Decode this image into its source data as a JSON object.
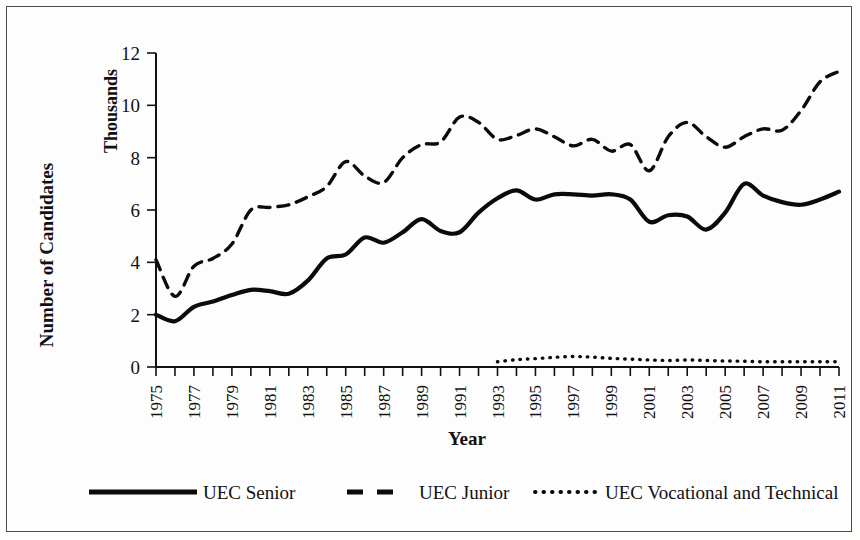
{
  "chart_data": {
    "type": "line",
    "title": "",
    "xlabel": "Year",
    "ylabel": "Number of Candidates",
    "unit_label": "Thousands",
    "xlim": [
      1975,
      2011
    ],
    "ylim": [
      0,
      12
    ],
    "ytick_step": 2,
    "yticks": [
      "0",
      "2",
      "4",
      "6",
      "8",
      "10",
      "12"
    ],
    "xticks": [
      "1975",
      "1977",
      "1979",
      "1981",
      "1983",
      "1985",
      "1987",
      "1989",
      "1991",
      "1993",
      "1995",
      "1997",
      "1999",
      "2001",
      "2003",
      "2005",
      "2007",
      "2009",
      "2011"
    ],
    "grid": false,
    "legend_position": "bottom",
    "x": [
      1975,
      1976,
      1977,
      1978,
      1979,
      1980,
      1981,
      1982,
      1983,
      1984,
      1985,
      1986,
      1987,
      1988,
      1989,
      1990,
      1991,
      1992,
      1993,
      1994,
      1995,
      1996,
      1997,
      1998,
      1999,
      2000,
      2001,
      2002,
      2003,
      2004,
      2005,
      2006,
      2007,
      2008,
      2009,
      2010,
      2011
    ],
    "series": [
      {
        "name": "UEC Senior",
        "style": "solid",
        "color": "#0b0b0b",
        "values": [
          2.0,
          1.75,
          2.3,
          2.5,
          2.75,
          2.95,
          2.9,
          2.8,
          3.3,
          4.15,
          4.3,
          4.95,
          4.75,
          5.15,
          5.65,
          5.2,
          5.15,
          5.9,
          6.45,
          6.75,
          6.4,
          6.6,
          6.6,
          6.55,
          6.6,
          6.4,
          5.55,
          5.8,
          5.75,
          5.25,
          5.9,
          7.0,
          6.55,
          6.3,
          6.2,
          6.4,
          6.7
        ]
      },
      {
        "name": "UEC Junior",
        "style": "dashed",
        "color": "#0b0b0b",
        "values": [
          4.1,
          2.7,
          3.85,
          4.15,
          4.7,
          6.0,
          6.1,
          6.2,
          6.5,
          6.9,
          7.85,
          7.3,
          7.05,
          8.0,
          8.5,
          8.6,
          9.55,
          9.35,
          8.7,
          8.85,
          9.1,
          8.8,
          8.45,
          8.7,
          8.25,
          8.5,
          7.5,
          8.8,
          9.35,
          8.8,
          8.4,
          8.8,
          9.1,
          9.05,
          9.8,
          10.9,
          11.3
        ]
      },
      {
        "name": "UEC Vocational and Technical",
        "style": "dotted",
        "color": "#0b0b0b",
        "start_year": 1993,
        "values": [
          null,
          null,
          null,
          null,
          null,
          null,
          null,
          null,
          null,
          null,
          null,
          null,
          null,
          null,
          null,
          null,
          null,
          null,
          0.2,
          0.28,
          0.32,
          0.37,
          0.4,
          0.38,
          0.33,
          0.3,
          0.27,
          0.25,
          0.27,
          0.25,
          0.23,
          0.22,
          0.2,
          0.2,
          0.2,
          0.2,
          0.2
        ]
      }
    ]
  },
  "legend": {
    "items": [
      {
        "label": "UEC Senior",
        "style": "solid"
      },
      {
        "label": "UEC Junior",
        "style": "dashed"
      },
      {
        "label": "UEC Vocational and Technical",
        "style": "dotted"
      }
    ]
  }
}
